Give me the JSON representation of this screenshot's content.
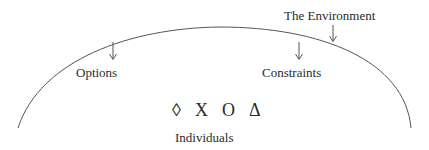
{
  "diagram": {
    "environment_label": "The Environment",
    "options_label": "Options",
    "constraints_label": "Constraints",
    "individuals_label": "Individuals",
    "symbols": [
      "◊",
      "X",
      "O",
      "Δ"
    ],
    "colors": {
      "line": "#555555",
      "text": "#2a2a2a",
      "background": "#ffffff"
    }
  }
}
